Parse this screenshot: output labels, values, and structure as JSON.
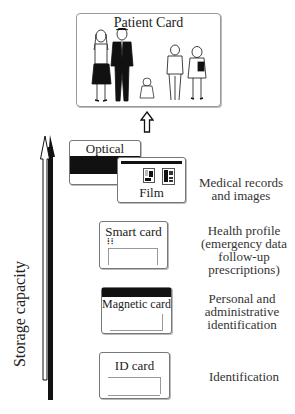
{
  "patient_card": {
    "title": "Patient Card",
    "figures": [
      "woman",
      "man",
      "baby",
      "boy",
      "girl"
    ]
  },
  "up_arrow_icon": "hollow-up-arrow",
  "axis": {
    "label": "Storage capacity",
    "direction": "up"
  },
  "levels": [
    {
      "cards": [
        "Optical",
        "Film"
      ],
      "description_lines": [
        "Medical records",
        "and images"
      ]
    },
    {
      "cards": [
        "Smart card"
      ],
      "description_lines": [
        "Health profile",
        "(emergency data",
        "follow-up",
        "prescriptions)"
      ]
    },
    {
      "cards": [
        "Magnetic card"
      ],
      "description_lines": [
        "Personal and",
        "administrative",
        "identification"
      ]
    },
    {
      "cards": [
        "ID card"
      ],
      "description_lines": [
        "Identification"
      ]
    }
  ]
}
